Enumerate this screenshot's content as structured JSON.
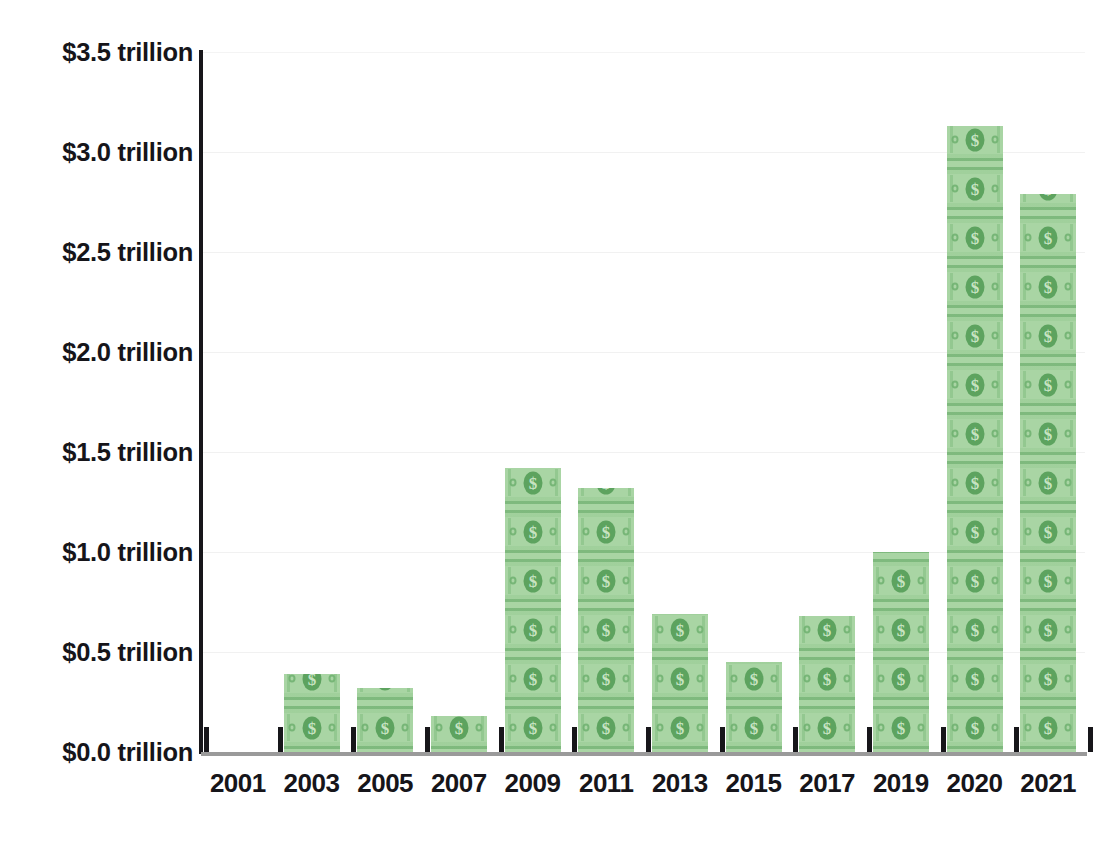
{
  "chart_data": {
    "type": "bar",
    "title": "",
    "xlabel": "",
    "ylabel": "",
    "categories": [
      "2001",
      "2003",
      "2005",
      "2007",
      "2009",
      "2011",
      "2013",
      "2015",
      "2017",
      "2019",
      "2020",
      "2021"
    ],
    "values": [
      0.0,
      0.39,
      0.32,
      0.18,
      1.42,
      1.32,
      0.69,
      0.45,
      0.68,
      1.0,
      3.13,
      2.79
    ],
    "unit": "trillion USD",
    "ylim": [
      0.0,
      3.5
    ],
    "ytick_values": [
      0.0,
      0.5,
      1.0,
      1.5,
      2.0,
      2.5,
      3.0,
      3.5
    ],
    "ytick_labels": [
      "$0.0 trillion",
      "$0.5 trillion",
      "$1.0 trillion",
      "$1.5 trillion",
      "$2.0 trillion",
      "$2.5 trillion",
      "$3.0 trillion",
      "$3.5 trillion"
    ],
    "grid": true,
    "legend": false,
    "bar_fill": "#a9d5a4",
    "bar_pattern": "dollar-bill-stack",
    "axis_color": "#16151a",
    "gridline_color": "#f1f1f1",
    "background": "#ffffff"
  },
  "axes": {
    "y_axis_name": "y-axis",
    "x_axis_name": "x-axis"
  }
}
